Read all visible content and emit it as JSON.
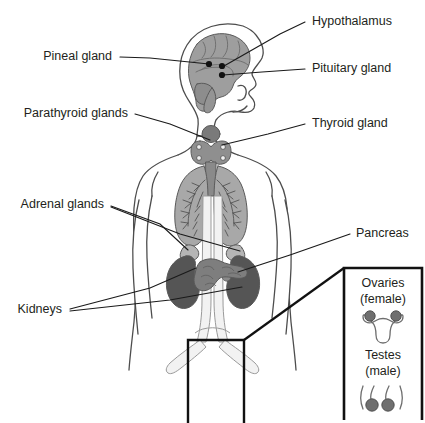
{
  "colors": {
    "background": "#ffffff",
    "text": "#231f20",
    "leader_line": "#1a1a1a",
    "body_outline": "#4d4d4d",
    "brain_fill": "#9e9e9e",
    "lung_fill": "#a8a8a8",
    "thyroid_fill": "#8f8f8f",
    "kidney_fill": "#555555",
    "adrenal_fill": "#b5b5b5",
    "pancreas_fill": "#7e7e7e",
    "gonad_fill": "#6f6f6f",
    "vessel_fill": "#f2f2f2",
    "inset_border": "#111111"
  },
  "labels": [
    {
      "id": "hypothalamus",
      "text": "Hypothalamus",
      "side": "right",
      "text_x": 312,
      "text_y": 22,
      "leader": "M 305 22 L 280 34 L 224 66",
      "target_dot": {
        "x": 222,
        "y": 66
      }
    },
    {
      "id": "pineal-gland",
      "text": "Pineal gland",
      "side": "left",
      "text_x": 112,
      "text_y": 57,
      "leader": "M 120 57 L 150 58 L 209 64",
      "target_dot": {
        "x": 209,
        "y": 64
      }
    },
    {
      "id": "pituitary-gland",
      "text": "Pituitary gland",
      "side": "right",
      "text_x": 312,
      "text_y": 69,
      "leader": "M 305 69 L 262 72 L 223 75",
      "target_dot": {
        "x": 222,
        "y": 75
      }
    },
    {
      "id": "parathyroid-glands",
      "text": "Parathyroid glands",
      "side": "left",
      "text_x": 128,
      "text_y": 114,
      "leader": "M 135 114 L 170 124 L 210 140",
      "target_dot": null
    },
    {
      "id": "thyroid-gland",
      "text": "Thyroid gland",
      "side": "right",
      "text_x": 312,
      "text_y": 124,
      "leader": "M 305 124 L 268 134 L 222 145",
      "target_dot": null
    },
    {
      "id": "adrenal-glands",
      "text": "Adrenal glands",
      "side": "left",
      "text_x": 104,
      "text_y": 205,
      "leader": "M 111 206 L 160 224 L 188 250",
      "target_dot": null
    },
    {
      "id": "adrenal-glands-right",
      "text": "",
      "side": "left",
      "text_x": 104,
      "text_y": 205,
      "leader": "M 111 207 L 180 234 L 240 251",
      "target_dot": null
    },
    {
      "id": "pancreas",
      "text": "Pancreas",
      "side": "right",
      "text_x": 356,
      "text_y": 234,
      "leader": "M 350 234 L 290 255 L 238 272",
      "target_dot": null
    },
    {
      "id": "kidneys",
      "text": "Kidneys",
      "side": "left",
      "text_x": 62,
      "text_y": 310,
      "leader": "M 70 309 L 150 288 L 196 268",
      "target_dot": null
    },
    {
      "id": "kidneys-right",
      "text": "",
      "side": "left",
      "text_x": 62,
      "text_y": 310,
      "leader": "M 70 311 L 170 300 L 242 287",
      "target_dot": null
    }
  ],
  "inset": {
    "box": {
      "x": 344,
      "y": 268,
      "width": 78,
      "height": 152
    },
    "items": [
      {
        "id": "ovaries",
        "title": "Ovaries",
        "subtitle": "(female)",
        "title_x": 383,
        "title_y": 284,
        "subtitle_x": 383,
        "subtitle_y": 300
      },
      {
        "id": "testes",
        "title": "Testes",
        "subtitle": "(male)",
        "title_x": 383,
        "title_y": 356,
        "subtitle_x": 383,
        "subtitle_y": 372
      }
    ]
  },
  "zoom_source_box": {
    "x": 188,
    "y": 340,
    "width": 56,
    "height": 83,
    "connector": "M 244 340 L 344 268"
  },
  "organs": [
    {
      "id": "brain",
      "name": "brain",
      "fill": "#9e9e9e"
    },
    {
      "id": "thyroid",
      "name": "thyroid-gland",
      "fill": "#8f8f8f"
    },
    {
      "id": "lungs",
      "name": "lungs",
      "fill": "#a8a8a8"
    },
    {
      "id": "kidney-left",
      "name": "kidney",
      "fill": "#555555"
    },
    {
      "id": "kidney-right",
      "name": "kidney",
      "fill": "#555555"
    },
    {
      "id": "adrenal-left",
      "name": "adrenal-gland",
      "fill": "#b5b5b5"
    },
    {
      "id": "adrenal-right",
      "name": "adrenal-gland",
      "fill": "#b5b5b5"
    },
    {
      "id": "pancreas",
      "name": "pancreas",
      "fill": "#7e7e7e"
    }
  ]
}
